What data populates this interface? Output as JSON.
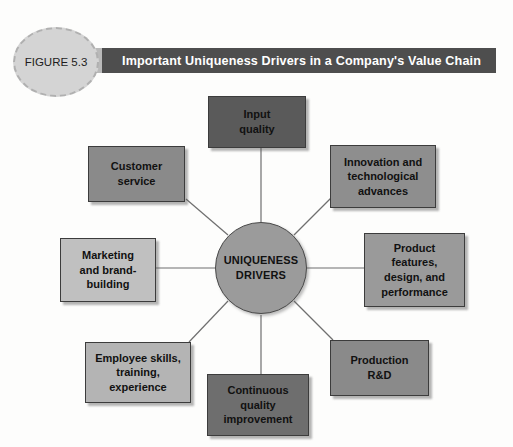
{
  "figure": {
    "badge_label": "FIGURE 5.3",
    "title": "Important Uniqueness Drivers in a Company's Value Chain",
    "title_bar_color": "#4e4e4e",
    "title_text_color": "#ffffff",
    "badge_fill_color": "#d4d4d4",
    "badge_border_color": "#b0b0b0",
    "page_background": "#fdfdfc"
  },
  "diagram": {
    "type": "radial-hub-and-spoke",
    "spoke_color": "#6f6f6f",
    "hub": {
      "label_line_1": "UNIQUENESS",
      "label_line_2": "DRIVERS",
      "fill_color": "#9b9b9b",
      "text_color": "#111111",
      "center_x": 261,
      "center_y": 268,
      "radius": 46
    },
    "nodes": [
      {
        "id": "input-quality",
        "label": "Input\nquality",
        "position": "top",
        "fill_color": "#5a5a5a",
        "x": 208,
        "y": 96,
        "width": 98,
        "height": 52
      },
      {
        "id": "innovation-technological-advances",
        "label": "Innovation and\ntechnological\nadvances",
        "position": "upper-right",
        "fill_color": "#8e8e8e",
        "x": 330,
        "y": 145,
        "width": 106,
        "height": 63
      },
      {
        "id": "product-features-design-performance",
        "label": "Product\nfeatures,\ndesign, and\nperformance",
        "position": "right",
        "fill_color": "#9a9a9a",
        "x": 364,
        "y": 233,
        "width": 101,
        "height": 74
      },
      {
        "id": "production-rd",
        "label": "Production\nR&D",
        "position": "lower-right",
        "fill_color": "#8a8a8a",
        "x": 330,
        "y": 340,
        "width": 99,
        "height": 56
      },
      {
        "id": "continuous-quality-improvement",
        "label": "Continuous\nquality\nimprovement",
        "position": "bottom",
        "fill_color": "#6e6e6e",
        "x": 207,
        "y": 374,
        "width": 102,
        "height": 62
      },
      {
        "id": "employee-skills-training-experience",
        "label": "Employee skills,\ntraining,\nexperience",
        "position": "lower-left",
        "fill_color": "#b4b4b4",
        "x": 85,
        "y": 342,
        "width": 106,
        "height": 61
      },
      {
        "id": "marketing-and-brand-building",
        "label": "Marketing\nand brand-\nbuilding",
        "position": "left",
        "fill_color": "#c0c0c0",
        "x": 60,
        "y": 238,
        "width": 96,
        "height": 64
      },
      {
        "id": "customer-service",
        "label": "Customer\nservice",
        "position": "upper-left",
        "fill_color": "#8a8a8a",
        "x": 88,
        "y": 146,
        "width": 97,
        "height": 56
      }
    ],
    "spokes": [
      {
        "from": "hub",
        "to": "input-quality",
        "x1": 261,
        "y1": 222,
        "x2": 261,
        "y2": 148
      },
      {
        "from": "hub",
        "to": "innovation-technological-advances",
        "x1": 294,
        "y1": 235,
        "x2": 333,
        "y2": 196
      },
      {
        "from": "hub",
        "to": "product-features-design-performance",
        "x1": 307,
        "y1": 268,
        "x2": 364,
        "y2": 268
      },
      {
        "from": "hub",
        "to": "production-rd",
        "x1": 294,
        "y1": 301,
        "x2": 333,
        "y2": 340
      },
      {
        "from": "hub",
        "to": "continuous-quality-improvement",
        "x1": 261,
        "y1": 315,
        "x2": 261,
        "y2": 374
      },
      {
        "from": "hub",
        "to": "employee-skills-training-experience",
        "x1": 228,
        "y1": 301,
        "x2": 189,
        "y2": 342
      },
      {
        "from": "hub",
        "to": "marketing-and-brand-building",
        "x1": 215,
        "y1": 268,
        "x2": 156,
        "y2": 268
      },
      {
        "from": "hub",
        "to": "customer-service",
        "x1": 228,
        "y1": 235,
        "x2": 186,
        "y2": 199
      }
    ]
  }
}
